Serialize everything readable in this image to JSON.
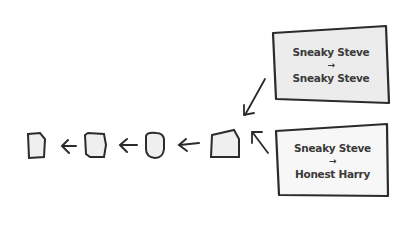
{
  "diagram": {
    "chain": {
      "blocks": [
        {
          "id": "block-1"
        },
        {
          "id": "block-2"
        },
        {
          "id": "block-3"
        },
        {
          "id": "block-4"
        }
      ],
      "arrow_direction": "left"
    },
    "transactions": [
      {
        "from": "Sneaky Steve",
        "arrow": "→",
        "to": "Sneaky Steve",
        "fill": "#ececec"
      },
      {
        "from": "Sneaky Steve",
        "arrow": "→",
        "to": "Honest Harry",
        "fill": "#f7f7f7"
      }
    ],
    "colors": {
      "stroke": "#2b2b2b",
      "block_fill": "#efefef"
    }
  }
}
